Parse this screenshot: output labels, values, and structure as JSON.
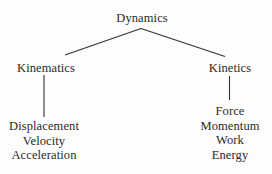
{
  "diagram": {
    "kind": "tree",
    "title": "Dynamics",
    "background_color": "#fdfdfd",
    "line_color": "#333333",
    "text_color": "#2a2a2a",
    "root": {
      "label": "Dynamics"
    },
    "branches": [
      {
        "label": "Kinematics",
        "leaves": [
          "Displacement",
          "Velocity",
          "Acceleration"
        ]
      },
      {
        "label": "Kinetics",
        "leaves": [
          "Force",
          "Momentum",
          "Work",
          "Energy"
        ]
      }
    ]
  }
}
